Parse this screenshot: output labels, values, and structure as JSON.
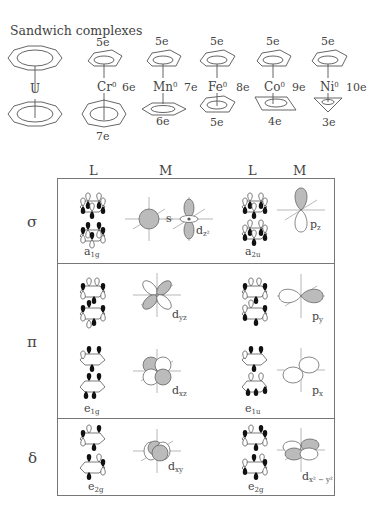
{
  "title": "Sandwich complexes",
  "complexes": [
    {
      "metal": "U",
      "ox": "",
      "top_e": "",
      "side_e": "",
      "bottom_e": ""
    },
    {
      "metal": "Cr",
      "ox": "0",
      "top_e": "5e",
      "side_e": "6e",
      "bottom_e": "7e"
    },
    {
      "metal": "Mn",
      "ox": "0",
      "top_e": "5e",
      "side_e": "7e",
      "bottom_e": "6e"
    },
    {
      "metal": "Fe",
      "ox": "0",
      "top_e": "5e",
      "side_e": "8e",
      "bottom_e": "5e"
    },
    {
      "metal": "Co",
      "ox": "0",
      "top_e": "5e",
      "side_e": "9e",
      "bottom_e": "4e"
    },
    {
      "metal": "Ni",
      "ox": "0",
      "top_e": "5e",
      "side_e": "10e",
      "bottom_e": "3e"
    }
  ],
  "table": {
    "headers": [
      "L",
      "M",
      "L",
      "M"
    ],
    "rows": [
      {
        "symmetry": "σ",
        "left": {
          "irrep": "a",
          "irrep_sub": "1g",
          "orbitals": [
            {
              "name": "s",
              "sub": ""
            },
            {
              "name": "d",
              "sub": "z²"
            }
          ]
        },
        "right": {
          "irrep": "a",
          "irrep_sub": "2u",
          "orbitals": [
            {
              "name": "p",
              "sub": "z"
            }
          ]
        }
      },
      {
        "symmetry": "π",
        "left": {
          "irrep": "e",
          "irrep_sub": "1g",
          "orbitals": [
            {
              "name": "d",
              "sub": "yz"
            },
            {
              "name": "d",
              "sub": "xz"
            }
          ]
        },
        "right": {
          "irrep": "e",
          "irrep_sub": "1u",
          "orbitals": [
            {
              "name": "p",
              "sub": "y"
            },
            {
              "name": "p",
              "sub": "x"
            }
          ]
        }
      },
      {
        "symmetry": "δ",
        "left": {
          "irrep": "e",
          "irrep_sub": "2g",
          "orbitals": [
            {
              "name": "d",
              "sub": "xy"
            }
          ]
        },
        "right": {
          "irrep": "e",
          "irrep_sub": "2g",
          "orbitals": [
            {
              "name": "d",
              "sub": "x² − y²"
            }
          ]
        }
      }
    ]
  },
  "colors": {
    "line": "#555555",
    "lobe_fill": "#bbbbbb",
    "black_lobe": "#111111",
    "border": "#777777"
  }
}
